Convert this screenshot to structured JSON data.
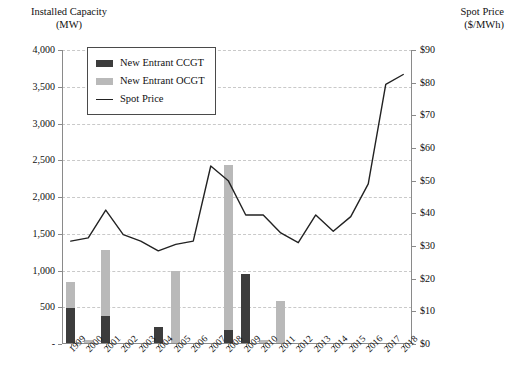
{
  "chart_data": {
    "type": "bar",
    "title": "",
    "subtitle": "",
    "xlabel": "",
    "ylabel": "Installed Capacity (MW)",
    "y2label": "Spot Price ($/MWh)",
    "grid": true,
    "legend_position": "top-left-inside",
    "categories": [
      "1999",
      "2000",
      "2001",
      "2002",
      "2003",
      "2004",
      "2005",
      "2006",
      "2007",
      "2008",
      "2009",
      "2010",
      "2011",
      "2012",
      "2013",
      "2014",
      "2015",
      "2016",
      "2017",
      "2018"
    ],
    "ylim": [
      0,
      4000
    ],
    "y2lim": [
      0,
      90
    ],
    "yticks": [
      "-",
      "500",
      "1,000",
      "1,500",
      "2,000",
      "2,500",
      "3,000",
      "3,500",
      "4,000"
    ],
    "ytick_values": [
      0,
      500,
      1000,
      1500,
      2000,
      2500,
      3000,
      3500,
      4000
    ],
    "y2ticks": [
      "$0",
      "$10",
      "$20",
      "$30",
      "$40",
      "$50",
      "$60",
      "$70",
      "$80",
      "$90"
    ],
    "y2tick_values": [
      0,
      10,
      20,
      30,
      40,
      50,
      60,
      70,
      80,
      90
    ],
    "series": [
      {
        "name": "New Entrant CCGT",
        "type": "bar",
        "stack": "capacity",
        "color": "#3c3c3c",
        "axis": "left",
        "values": [
          490,
          0,
          385,
          0,
          0,
          230,
          0,
          0,
          0,
          190,
          950,
          0,
          0,
          0,
          0,
          0,
          0,
          0,
          0,
          0
        ]
      },
      {
        "name": "New Entrant OCGT",
        "type": "bar",
        "stack": "capacity",
        "color": "#b9b9b9",
        "axis": "left",
        "values": [
          355,
          60,
          895,
          0,
          0,
          0,
          1000,
          0,
          0,
          2245,
          0,
          60,
          580,
          0,
          0,
          0,
          0,
          0,
          0,
          0
        ]
      },
      {
        "name": "Spot Price",
        "type": "line",
        "color": "#222222",
        "axis": "right",
        "values": [
          31.5,
          32.5,
          41.0,
          33.5,
          31.5,
          28.5,
          30.5,
          31.5,
          54.5,
          50.0,
          39.5,
          39.5,
          34.0,
          31.0,
          39.5,
          34.5,
          39.0,
          49.0,
          79.5,
          82.5
        ]
      }
    ],
    "legend": [
      {
        "label": "New Entrant CCGT",
        "marker": "swatch",
        "color": "#3c3c3c"
      },
      {
        "label": "New Entrant OCGT",
        "marker": "swatch",
        "color": "#b9b9b9"
      },
      {
        "label": "Spot Price",
        "marker": "line",
        "color": "#222222"
      }
    ]
  },
  "axis_titles": {
    "left_line1": "Installed Capacity",
    "left_line2": "(MW)",
    "right_line1": "Spot Price",
    "right_line2": "($/MWh)"
  },
  "colors": {
    "ccgt": "#3c3c3c",
    "ocgt": "#b9b9b9",
    "line": "#222222",
    "grid": "#c9c9c9",
    "axis": "#8a8a8a",
    "background": "#ffffff"
  }
}
